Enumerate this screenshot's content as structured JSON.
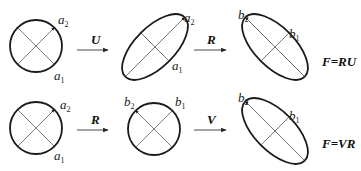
{
  "diagram": {
    "rows": [
      {
        "shapes": [
          {
            "type": "circle",
            "labels": {
              "upper": "a",
              "upper_sub": "2",
              "lower": "a",
              "lower_sub": "1"
            }
          },
          {
            "type": "ellipse",
            "labels": {
              "upper": "a",
              "upper_sub": "2",
              "lower": "a",
              "lower_sub": "1"
            }
          },
          {
            "type": "ellipse",
            "labels": {
              "left": "b",
              "left_sub": "2",
              "right": "b",
              "right_sub": "1"
            }
          }
        ],
        "operators": [
          "U",
          "R"
        ],
        "equation": "F=RU"
      },
      {
        "shapes": [
          {
            "type": "circle",
            "labels": {
              "upper": "a",
              "upper_sub": "2",
              "lower": "a",
              "lower_sub": "1"
            }
          },
          {
            "type": "circle",
            "labels": {
              "left": "b",
              "left_sub": "2",
              "right": "b",
              "right_sub": "1"
            }
          },
          {
            "type": "ellipse",
            "labels": {
              "left": "b",
              "left_sub": "2",
              "right": "b",
              "right_sub": "1"
            }
          }
        ],
        "operators": [
          "R",
          "V"
        ],
        "equation": "F=VR"
      }
    ]
  }
}
